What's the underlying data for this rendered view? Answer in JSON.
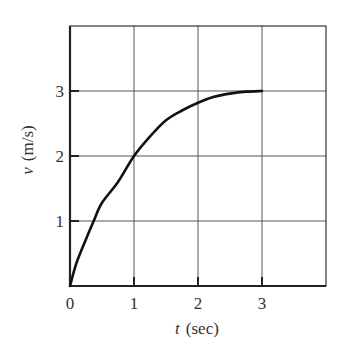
{
  "chart_data": {
    "type": "line",
    "title": "",
    "xlabel": "t (sec)",
    "xlabel_var": "t",
    "xlabel_unit": "(sec)",
    "ylabel": "v (m/s)",
    "ylabel_var": "v",
    "ylabel_unit": "(m/s)",
    "xlim": [
      0,
      4
    ],
    "ylim": [
      0,
      4
    ],
    "xticks": [
      0,
      1,
      2,
      3
    ],
    "yticks": [
      1,
      2,
      3
    ],
    "xtick_labels": [
      "0",
      "1",
      "2",
      "3"
    ],
    "ytick_labels": [
      "1",
      "2",
      "3"
    ],
    "grid": true,
    "legend": null,
    "series": [
      {
        "name": "v(t)",
        "x": [
          0,
          0.1,
          0.25,
          0.37,
          0.5,
          0.75,
          1.0,
          1.25,
          1.5,
          1.75,
          2.0,
          2.25,
          2.5,
          2.75,
          3.0
        ],
        "y": [
          0,
          0.35,
          0.72,
          1.0,
          1.28,
          1.6,
          2.0,
          2.3,
          2.55,
          2.7,
          2.82,
          2.91,
          2.96,
          2.99,
          3.0
        ]
      }
    ]
  }
}
